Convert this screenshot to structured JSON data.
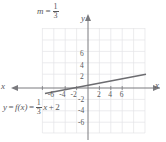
{
  "figure": {
    "slope_label": {
      "prefix": "m",
      "equals": "=",
      "numerator": "1",
      "denominator": "3"
    },
    "equation_label": {
      "lhs": "y",
      "eq1": "=",
      "fx": "f(x)",
      "eq2": "=",
      "numerator": "1",
      "denominator": "3",
      "variable": "x",
      "plus": "+",
      "intercept": "2"
    },
    "axis_labels": {
      "y": "y",
      "x_right": "x",
      "x_left": "x"
    },
    "colors": {
      "line": "#6c6c70",
      "axis": "#7a7a7e",
      "grid": "#e2e2e4",
      "text": "#58585a",
      "background": "#ffffff"
    }
  },
  "chart_data": {
    "type": "line",
    "title": "",
    "subtitle": "",
    "xlabel": "x",
    "ylabel": "y",
    "xlim": [
      -8,
      8
    ],
    "ylim": [
      -8,
      8
    ],
    "grid": true,
    "legend": null,
    "xticks": [
      -6,
      -4,
      -2,
      2,
      4,
      6
    ],
    "xtick_labels": [
      "-6",
      "-4",
      "-2",
      "2",
      "4",
      "6"
    ],
    "yticks": [
      6,
      4,
      2,
      -2,
      -4,
      -6
    ],
    "ytick_labels": [
      "6",
      "4",
      "2",
      "-2",
      "-4",
      "-6"
    ],
    "series": [
      {
        "name": "y = f(x) = (1/3)x + 2",
        "equation": "y = (1/3)x + 2",
        "slope": 0.3333333333333333,
        "slope_text": "1/3",
        "intercept": 2,
        "x_intercept": -6,
        "x": [
          -7.5,
          7.5
        ],
        "values": [
          -0.5,
          4.5
        ]
      }
    ],
    "annotations": [
      {
        "text": "m = 1/3",
        "x": -6.5,
        "y": 9.0
      },
      {
        "text": "y = f(x) = (1/3)x + 2",
        "x": -8.0,
        "y": -3.0
      }
    ]
  }
}
